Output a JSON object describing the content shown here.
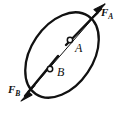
{
  "figure": {
    "kind": "free-body-diagram",
    "background_color": "#ffffff",
    "ink_color": "#111111",
    "body": {
      "shape": "ellipse",
      "center_x": 62,
      "center_y": 55,
      "semi_major": 47,
      "semi_minor": 31,
      "rotation_deg": -56,
      "stroke_width": 2.2,
      "fill": "none"
    },
    "line_of_action": {
      "name": "line-of-action",
      "x1": 22,
      "y1": 100,
      "x2": 104,
      "y2": 6,
      "stroke_width": 1.1
    },
    "vectors": [
      {
        "name": "force-vector-a",
        "label": "F",
        "subscript": "A",
        "direction": "upper-right",
        "tail_x": 60,
        "tail_y": 48,
        "tip_x": 104,
        "tip_y": 6,
        "arrow_filled": true
      },
      {
        "name": "force-vector-b",
        "label": "F",
        "subscript": "B",
        "direction": "lower-left",
        "tail_x": 62,
        "tail_y": 53,
        "tip_x": 22,
        "tip_y": 100,
        "arrow_filled": true
      }
    ],
    "points": [
      {
        "name": "point-a",
        "label": "A",
        "marker": "open-circle",
        "x": 70,
        "y": 40,
        "radius": 2.6
      },
      {
        "name": "point-b",
        "label": "B",
        "marker": "open-circle",
        "x": 50,
        "y": 69,
        "radius": 2.6
      }
    ]
  }
}
